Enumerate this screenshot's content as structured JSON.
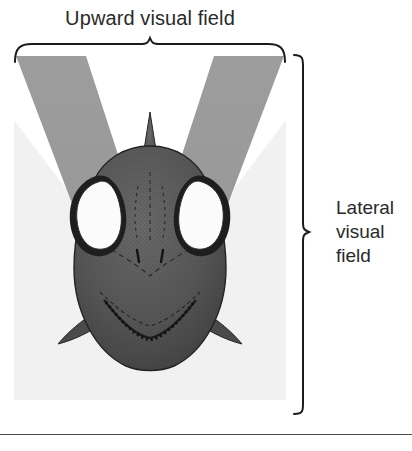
{
  "figure": {
    "kind": "anatomical-diagram",
    "top_label": "Upward visual field",
    "side_label_lines": [
      "Lateral",
      "visual",
      "field"
    ],
    "side_label_text": "Lateral visual field",
    "colors": {
      "upward_field_wedge": "#9a9a9a",
      "lateral_field_wedge": "#f0f0f0",
      "head_dark": "#4a4a4a",
      "head_mid": "#5d5d5d",
      "eye_white": "#fbfbfb",
      "outline": "#2b2b2b",
      "rule": "#4b4b4b",
      "panel_background": "#ffffff"
    },
    "parts": {
      "dorsal_spine": "dorsal-spine",
      "left_eye": "left-eye",
      "right_eye": "right-eye",
      "left_opercular_spine": "left-opercular-spine",
      "right_opercular_spine": "right-opercular-spine",
      "head_body": "head-outline"
    },
    "braces": {
      "top": "top-brace",
      "right": "right-brace"
    }
  }
}
